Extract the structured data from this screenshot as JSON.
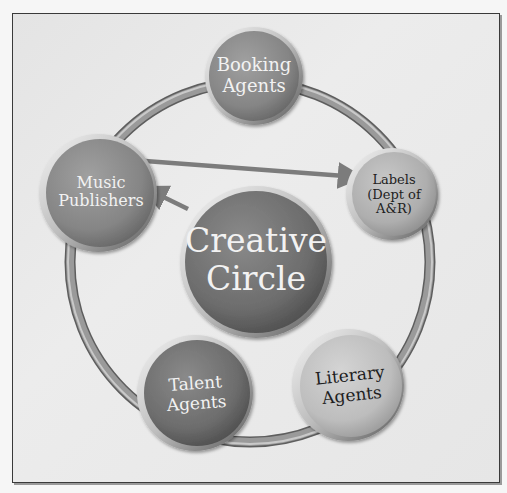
{
  "diagram": {
    "type": "cycle",
    "center": {
      "label_line1": "Creative",
      "label_line2": "Circle",
      "fill": "#6e6e6e"
    },
    "nodes": [
      {
        "id": "booking-agents",
        "line1": "Booking",
        "line2": "Agents",
        "fill": "#7a7a7a",
        "text_color": "#f2f2f2"
      },
      {
        "id": "labels",
        "line1": "Labels",
        "line2": "(Dept of",
        "line3": "A&R)",
        "fill": "#a4a4a4",
        "text_color": "#1e1e1e"
      },
      {
        "id": "literary-agents",
        "line1": "Literary",
        "line2": "Agents",
        "fill": "#b8b8b8",
        "text_color": "#1e1e1e"
      },
      {
        "id": "talent-agents",
        "line1": "Talent",
        "line2": "Agents",
        "fill": "#757575",
        "text_color": "#f2f2f2"
      },
      {
        "id": "music-publishers",
        "line1": "Music",
        "line2": "Publishers",
        "fill": "#8a8a8a",
        "text_color": "#f2f2f2"
      }
    ],
    "arrows": [
      {
        "from": "Music Publishers",
        "to": "Labels (Dept of A&R)"
      },
      {
        "from": "Creative Circle",
        "to": "Music Publishers"
      }
    ],
    "ring_color": "#8c8c8c",
    "arrow_color": "#7c7c7c"
  }
}
